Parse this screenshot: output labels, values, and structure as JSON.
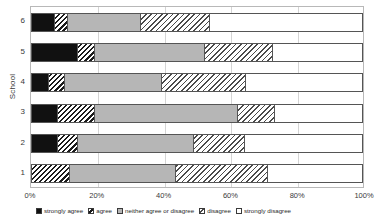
{
  "chart_data": {
    "type": "bar",
    "orientation": "horizontal",
    "stacked": true,
    "normalized": true,
    "title": "",
    "xlabel": "",
    "ylabel": "School",
    "xlim": [
      0,
      100
    ],
    "xticks": [
      "0%",
      "20%",
      "40%",
      "60%",
      "80%",
      "100%"
    ],
    "xtick_values": [
      0,
      20,
      40,
      60,
      80,
      100
    ],
    "categories": [
      "1",
      "2",
      "3",
      "4",
      "5",
      "6"
    ],
    "category_order_top_to_bottom": [
      "6",
      "5",
      "4",
      "3",
      "2",
      "1"
    ],
    "grid": "vertical",
    "legend_position": "bottom",
    "series": [
      {
        "name": "strongly agree",
        "fill": "solid-black",
        "color": "#111111",
        "values": [
          0.0,
          8.0,
          8.0,
          5.0,
          14.0,
          7.0
        ]
      },
      {
        "name": "agree",
        "fill": "diagonal-hatch-dense",
        "color": "#1a1a1a",
        "values": [
          11.5,
          6.0,
          11.0,
          5.0,
          5.0,
          4.0
        ]
      },
      {
        "name": "neither agree or disagree",
        "fill": "solid-gray",
        "color": "#b6b6b6",
        "values": [
          32.0,
          35.0,
          43.5,
          29.5,
          33.5,
          22.0
        ]
      },
      {
        "name": "disagree",
        "fill": "diagonal-hatch-light",
        "color": "#4a4a4a",
        "values": [
          28.0,
          15.5,
          11.0,
          25.5,
          20.5,
          21.0
        ]
      },
      {
        "name": "strongly disagree",
        "fill": "white",
        "color": "#ffffff",
        "values": [
          28.5,
          35.5,
          26.5,
          35.0,
          27.0,
          46.0
        ]
      }
    ],
    "cumulative_boundaries_pct": {
      "6": [
        7.0,
        11.0,
        33.0,
        54.0,
        100.0
      ],
      "5": [
        14.0,
        19.0,
        52.5,
        73.0,
        100.0
      ],
      "4": [
        5.0,
        10.0,
        39.5,
        65.0,
        100.0
      ],
      "3": [
        8.0,
        19.0,
        62.5,
        73.5,
        100.0
      ],
      "2": [
        8.0,
        14.0,
        49.0,
        64.5,
        100.0
      ],
      "1": [
        0.0,
        11.5,
        43.5,
        71.5,
        100.0
      ]
    }
  },
  "axes": {
    "y_title": "School",
    "y_ticks": [
      "6",
      "5",
      "4",
      "3",
      "2",
      "1"
    ],
    "x_ticks": [
      "0%",
      "20%",
      "40%",
      "60%",
      "80%",
      "100%"
    ]
  },
  "legend": {
    "items": [
      {
        "label": "strongly agree"
      },
      {
        "label": "agree"
      },
      {
        "label": "neither agree or disagree"
      },
      {
        "label": "disagree"
      },
      {
        "label": "strongly disagree"
      }
    ]
  }
}
